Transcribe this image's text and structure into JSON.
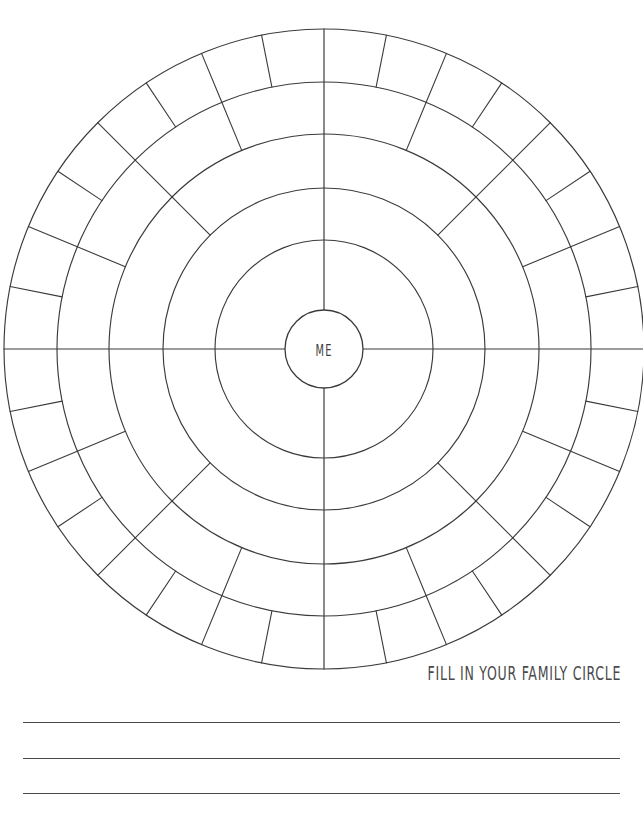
{
  "page": {
    "title": "Fill In Your Family Circle",
    "background_color": "#ffffff",
    "ink_color": "#3b3b3b",
    "width": 643,
    "height": 815
  },
  "diagram": {
    "name": "family-circle-wheel",
    "center_label": "ME",
    "center": {
      "x": 324,
      "y": 349
    },
    "ring_radii": [
      39,
      109,
      161,
      215,
      267,
      320
    ],
    "rings": [
      {
        "index": 1,
        "inner_radius": 39,
        "outer_radius": 109,
        "segments": 4,
        "segment_degrees": 90
      },
      {
        "index": 2,
        "inner_radius": 109,
        "outer_radius": 161,
        "segments": 4,
        "segment_degrees": 90
      },
      {
        "index": 3,
        "inner_radius": 161,
        "outer_radius": 215,
        "segments": 8,
        "segment_degrees": 45
      },
      {
        "index": 4,
        "inner_radius": 215,
        "outer_radius": 267,
        "segments": 16,
        "segment_degrees": 22.5
      },
      {
        "index": 5,
        "inner_radius": 267,
        "outer_radius": 320,
        "segments": 32,
        "segment_degrees": 11.25
      }
    ],
    "axes": [
      "vertical",
      "horizontal"
    ]
  },
  "caption": {
    "text": "FILL IN YOUR FAMILY CIRCLE"
  },
  "write_lines": {
    "count": 3,
    "positions_y": [
      722,
      758,
      793
    ],
    "left": 23,
    "width": 597
  }
}
